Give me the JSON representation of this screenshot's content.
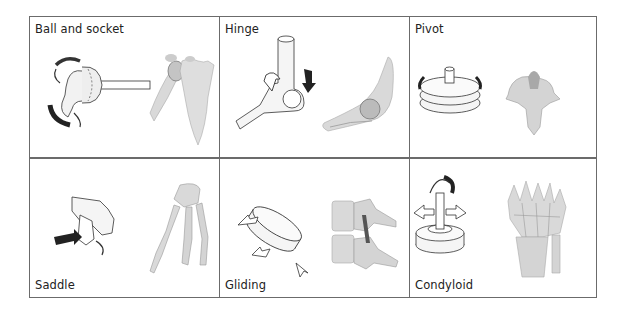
{
  "figure": {
    "cells": [
      {
        "label": "Ball and socket",
        "label_position": "top",
        "model_icon": "ball-socket-model",
        "anatomy_icon": "shoulder-joint"
      },
      {
        "label": "Hinge",
        "label_position": "top",
        "model_icon": "hinge-model",
        "anatomy_icon": "elbow-joint"
      },
      {
        "label": "Pivot",
        "label_position": "top",
        "model_icon": "pivot-model",
        "anatomy_icon": "atlas-vertebra"
      },
      {
        "label": "Saddle",
        "label_position": "bottom",
        "model_icon": "saddle-model",
        "anatomy_icon": "thumb-carpometacarpal"
      },
      {
        "label": "Gliding",
        "label_position": "bottom",
        "model_icon": "gliding-model",
        "anatomy_icon": "vertebral-facet-joints"
      },
      {
        "label": "Condyloid",
        "label_position": "bottom",
        "model_icon": "condyloid-model",
        "anatomy_icon": "wrist-joint"
      }
    ],
    "colors": {
      "border": "#6b6b6b",
      "bone": "#d9d9d9",
      "bone_shade": "#a8a8a8",
      "arrow_dark": "#2a2a2a",
      "line": "#333333"
    }
  }
}
